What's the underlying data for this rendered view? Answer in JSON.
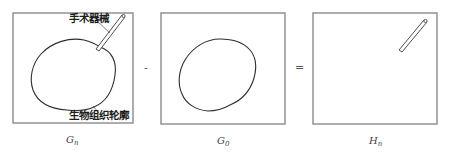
{
  "diagram": {
    "operators": {
      "minus": "-",
      "equals": "="
    },
    "panels": [
      {
        "id": "Gn",
        "label_main": "G",
        "label_sub": "n",
        "annotations": {
          "instrument": "手术器械",
          "tissue": "生物组织轮廓"
        },
        "contents": [
          "tissue-contour",
          "surgical-instrument"
        ]
      },
      {
        "id": "G0",
        "label_main": "G",
        "label_sub": "0",
        "contents": [
          "tissue-contour"
        ]
      },
      {
        "id": "Hn",
        "label_main": "H",
        "label_sub": "n",
        "contents": [
          "surgical-instrument"
        ]
      }
    ],
    "colors": {
      "frame": "#8a8a8a",
      "contour": "#2e2e2e",
      "text": "#1e1e1e"
    }
  }
}
